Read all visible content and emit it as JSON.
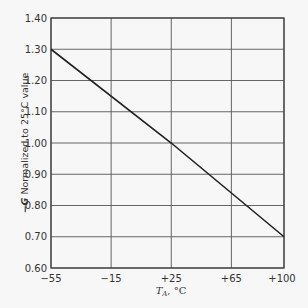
{
  "chart_data": {
    "type": "line",
    "title": "",
    "xlabel": "T_A, °C",
    "xlabel_main": "T",
    "xlabel_sub": "A",
    "xlabel_unit": ", °C",
    "ylabel": "−G Normalized to 25°C value",
    "ylabel_prefix": "−G",
    "ylabel_rest": " Normalized to 25°C value",
    "x_ticks": [
      -55,
      -15,
      25,
      65,
      100
    ],
    "x_tick_labels": [
      "−55",
      "−15",
      "+25",
      "+65",
      "+100"
    ],
    "y_ticks": [
      0.6,
      0.7,
      0.8,
      0.9,
      1.0,
      1.1,
      1.2,
      1.3,
      1.4
    ],
    "y_tick_labels": [
      "0.60",
      "0.70",
      "0.80",
      "0.90",
      "1.00",
      "1.10",
      "1.20",
      "1.30",
      "1.40"
    ],
    "xlim": [
      -55,
      100
    ],
    "ylim": [
      0.6,
      1.4
    ],
    "grid": true,
    "series": [
      {
        "name": "-G normalized",
        "x": [
          -55,
          25,
          100
        ],
        "y": [
          1.3,
          1.0,
          0.7
        ]
      }
    ]
  },
  "colors": {
    "background": "#f7f7f7",
    "line": "#222222",
    "grid": "#555555"
  }
}
